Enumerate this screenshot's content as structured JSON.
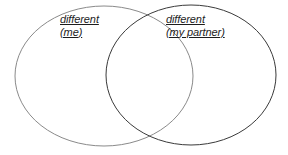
{
  "diagram": {
    "type": "venn",
    "title": "",
    "background_color": "#ffffff",
    "sets": [
      {
        "id": "left",
        "name": "me-set",
        "label_lines": [
          "different",
          "(me)"
        ],
        "stroke_color": "#8a8a8a",
        "stroke_width": 1,
        "fill": "none",
        "center_x": 104,
        "center_y": 76,
        "radius_x": 89,
        "radius_y": 70
      },
      {
        "id": "right",
        "name": "partner-set",
        "label_lines": [
          "different",
          "(my partner)"
        ],
        "stroke_color": "#3a3a3a",
        "stroke_width": 1,
        "fill": "none",
        "center_x": 191,
        "center_y": 75,
        "radius_x": 85,
        "radius_y": 70
      }
    ],
    "overlap": {
      "name": "shared-region",
      "label": "",
      "top_intersection_x": 145,
      "top_intersection_y": 10,
      "bottom_intersection_x": 143,
      "bottom_intersection_y": 135
    },
    "text_color": "#1d1d1d"
  }
}
